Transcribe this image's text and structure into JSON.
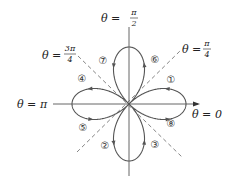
{
  "diagram": {
    "curve": "r = cos(2θ)",
    "axis_labels": {
      "theta_0": {
        "lhs": "θ =",
        "value": "0"
      },
      "theta_pi": {
        "lhs": "θ =",
        "value": "π"
      },
      "theta_pi_2": {
        "lhs": "θ =",
        "num": "π",
        "den": "2"
      },
      "theta_pi_4": {
        "lhs": "θ =",
        "num": "π",
        "den": "4"
      },
      "theta_3pi_4": {
        "lhs": "θ =",
        "num": "3π",
        "den": "4"
      }
    },
    "segment_labels": [
      "①",
      "②",
      "③",
      "④",
      "⑤",
      "⑥",
      "⑦",
      "⑧"
    ],
    "colors": {
      "curve": "#555555",
      "axis": "#555555",
      "dashed": "#777777",
      "text": "#222222"
    }
  }
}
